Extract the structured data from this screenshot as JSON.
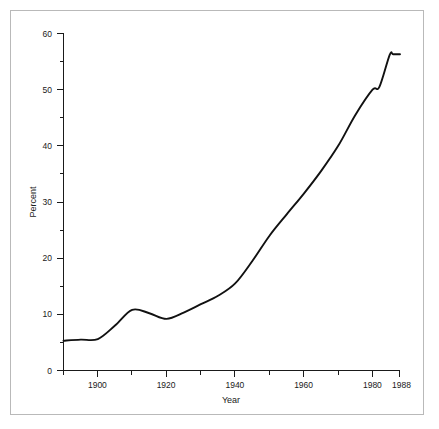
{
  "figure": {
    "background_color": "#ffffff",
    "frame_color": "#b9b9b9",
    "line_color": "#111111"
  },
  "axes": {
    "y_title": "Percent",
    "x_title": "Year",
    "y_tick_labels": [
      "0",
      "10",
      "20",
      "30",
      "40",
      "50",
      "60"
    ],
    "x_tick_labels": [
      "1900",
      "1920",
      "1940",
      "1960",
      "1980",
      "1988"
    ]
  },
  "chart_data": {
    "type": "line",
    "title": "",
    "subtitle": "",
    "xlabel": "Year",
    "ylabel": "Percent",
    "xlim": [
      1890,
      1988
    ],
    "ylim": [
      0,
      60
    ],
    "grid": false,
    "legend": false,
    "legend_position": "none",
    "x_major_ticks": [
      1900,
      1920,
      1940,
      1960,
      1980,
      1988
    ],
    "x_minor_ticks": [
      1890,
      1910,
      1930,
      1950,
      1970
    ],
    "y_major_ticks": [
      0,
      10,
      20,
      30,
      40,
      50,
      60
    ],
    "y_minor_ticks": [
      5,
      15,
      25,
      35,
      45,
      55
    ],
    "series": [
      {
        "name": "Percent",
        "color": "#111111",
        "marker": "none",
        "x": [
          1890,
          1895,
          1900,
          1905,
          1910,
          1915,
          1920,
          1925,
          1930,
          1935,
          1940,
          1945,
          1950,
          1955,
          1960,
          1965,
          1970,
          1975,
          1980,
          1982,
          1985,
          1986,
          1988
        ],
        "values": [
          5.3,
          5.5,
          5.6,
          8.0,
          10.8,
          10.2,
          9.2,
          10.3,
          11.8,
          13.3,
          15.5,
          19.5,
          24.0,
          27.8,
          31.5,
          35.5,
          40.0,
          45.5,
          50.0,
          50.5,
          56.2,
          56.3,
          56.3
        ]
      }
    ],
    "annotations": []
  }
}
